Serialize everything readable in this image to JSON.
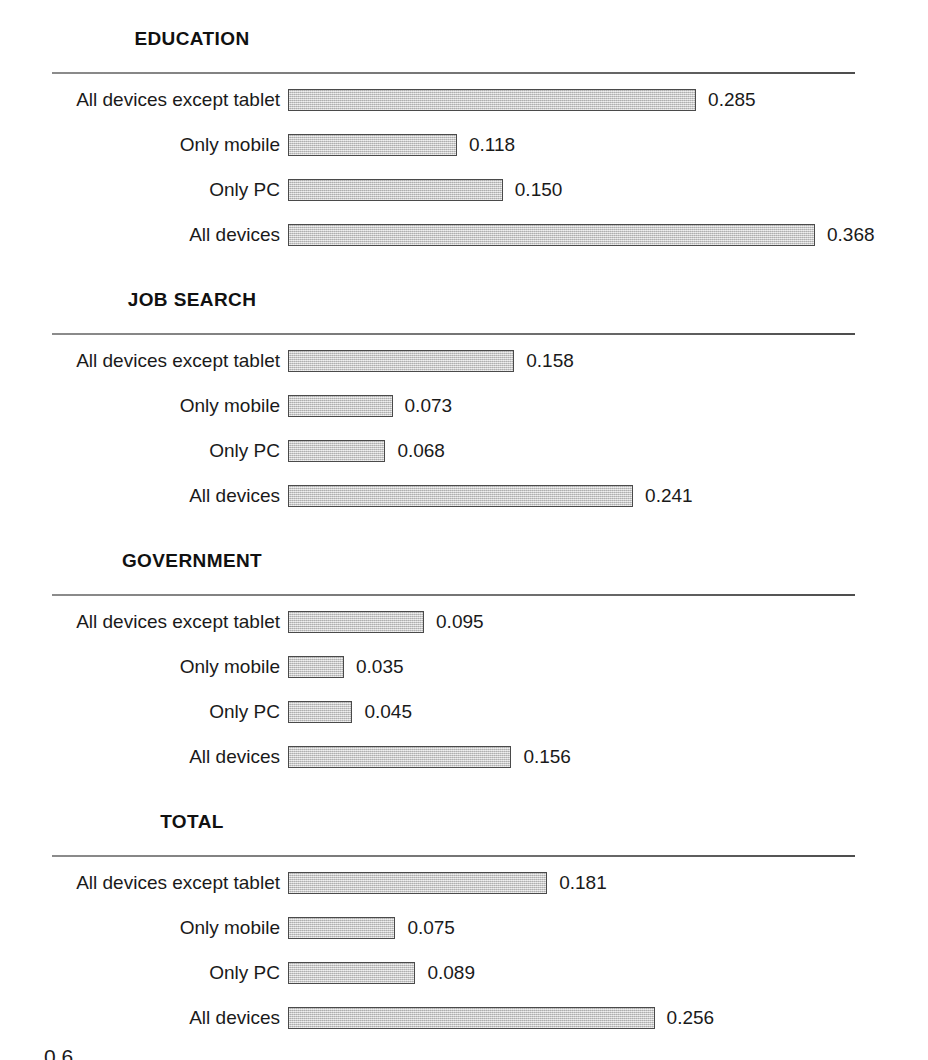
{
  "figure": {
    "background_color": "#ffffff",
    "bar_fill_color": "#c8c8c8",
    "bar_border_color": "#4a4a4a",
    "text_color": "#1a1a1a",
    "rule_color": "#5a5a5a",
    "bottom_fragment": "0.6"
  },
  "chart_data": [
    {
      "type": "bar",
      "orientation": "horizontal",
      "title": "EDUCATION",
      "xlabel": "",
      "ylabel": "",
      "categories": [
        "All devices except tablet",
        "Only mobile",
        "Only PC",
        "All devices"
      ],
      "values": [
        0.285,
        0.118,
        0.15,
        0.368
      ],
      "value_labels": [
        "0.285",
        "0.118",
        "0.150",
        "0.368"
      ],
      "xlim": [
        0,
        0.4
      ],
      "grid": false,
      "legend": "none"
    },
    {
      "type": "bar",
      "orientation": "horizontal",
      "title": "JOB SEARCH",
      "xlabel": "",
      "ylabel": "",
      "categories": [
        "All devices except tablet",
        "Only mobile",
        "Only PC",
        "All devices"
      ],
      "values": [
        0.158,
        0.073,
        0.068,
        0.241
      ],
      "value_labels": [
        "0.158",
        "0.073",
        "0.068",
        "0.241"
      ],
      "xlim": [
        0,
        0.4
      ],
      "grid": false,
      "legend": "none"
    },
    {
      "type": "bar",
      "orientation": "horizontal",
      "title": "GOVERNMENT",
      "xlabel": "",
      "ylabel": "",
      "categories": [
        "All devices except tablet",
        "Only mobile",
        "Only PC",
        "All devices"
      ],
      "values": [
        0.095,
        0.035,
        0.045,
        0.156
      ],
      "value_labels": [
        "0.095",
        "0.035",
        "0.045",
        "0.156"
      ],
      "xlim": [
        0,
        0.4
      ],
      "grid": false,
      "legend": "none"
    },
    {
      "type": "bar",
      "orientation": "horizontal",
      "title": "TOTAL",
      "xlabel": "",
      "ylabel": "",
      "categories": [
        "All devices except tablet",
        "Only mobile",
        "Only PC",
        "All devices"
      ],
      "values": [
        0.181,
        0.075,
        0.089,
        0.256
      ],
      "value_labels": [
        "0.181",
        "0.075",
        "0.089",
        "0.256"
      ],
      "xlim": [
        0,
        0.4
      ],
      "grid": false,
      "legend": "none"
    }
  ],
  "layout": {
    "panel_tops": [
      26,
      287,
      548,
      809
    ],
    "rule_offset": 46,
    "rows_offset": 63,
    "row_pitch": 45,
    "bar_left": 288,
    "px_per_unit": 1432,
    "min_bar_px": 56,
    "value_gap": 12
  }
}
